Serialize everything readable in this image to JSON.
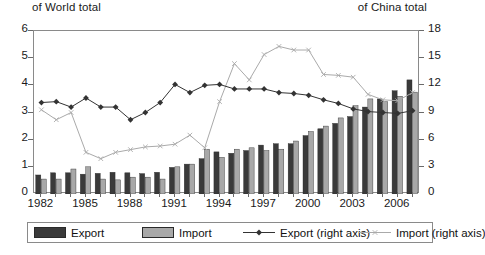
{
  "header": {
    "left_label": "of World total",
    "right_label": "of China total"
  },
  "legend": {
    "items": [
      {
        "label": "Export",
        "kind": "bar",
        "color": "#3a3a3a"
      },
      {
        "label": "Import",
        "kind": "bar",
        "color": "#a8a8a8"
      },
      {
        "label": "Export (right axis)",
        "kind": "line",
        "color": "#333333",
        "marker": "diamond"
      },
      {
        "label": "Import (right axis)",
        "kind": "line",
        "color": "#aaaaaa",
        "marker": "cross"
      }
    ]
  },
  "chart_data": {
    "type": "bar",
    "title": "",
    "xlabel": "",
    "ylabel": "of World total",
    "y2label": "of China total",
    "ylim": [
      0,
      6
    ],
    "y2lim": [
      0,
      18
    ],
    "yticks": [
      "0",
      "1",
      "2",
      "3",
      "4",
      "5",
      "6"
    ],
    "y2ticks": [
      "0",
      "3",
      "6",
      "9",
      "12",
      "15",
      "18"
    ],
    "grid": false,
    "legend_position": "bottom",
    "x": [
      1982,
      1983,
      1984,
      1985,
      1986,
      1987,
      1988,
      1989,
      1990,
      1991,
      1992,
      1993,
      1994,
      1995,
      1996,
      1997,
      1998,
      1999,
      2000,
      2001,
      2002,
      2003,
      2004,
      2005,
      2006,
      2007
    ],
    "xtick_labels": [
      "1982",
      "1985",
      "1988",
      "1991",
      "1994",
      "1997",
      "2000",
      "2003",
      "2006"
    ],
    "xtick_values": [
      1982,
      1985,
      1988,
      1991,
      1994,
      1997,
      2000,
      2003,
      2006
    ],
    "series": [
      {
        "name": "Export",
        "axis": "left",
        "type": "bar",
        "color": "#3a3a3a",
        "values": [
          0.7,
          0.78,
          0.78,
          0.73,
          0.76,
          0.8,
          0.78,
          0.75,
          0.8,
          0.98,
          1.1,
          1.3,
          1.55,
          1.5,
          1.6,
          1.8,
          1.85,
          1.85,
          2.15,
          2.4,
          2.6,
          2.85,
          3.2,
          3.5,
          3.8,
          4.2
        ]
      },
      {
        "name": "Import",
        "axis": "left",
        "type": "bar",
        "color": "#a8a8a8",
        "values": [
          0.55,
          0.55,
          0.92,
          1.0,
          0.55,
          0.52,
          0.62,
          0.62,
          0.55,
          1.0,
          1.1,
          1.65,
          1.35,
          1.65,
          1.7,
          1.6,
          1.65,
          1.95,
          2.3,
          2.5,
          2.8,
          3.25,
          3.5,
          3.4,
          3.6,
          3.75
        ]
      },
      {
        "name": "Export (right axis)",
        "axis": "right",
        "type": "line",
        "color": "#333333",
        "marker": "diamond",
        "values": [
          10.1,
          10.2,
          9.6,
          10.6,
          9.6,
          9.6,
          8.2,
          9.0,
          10.1,
          12.1,
          11.2,
          12.0,
          12.1,
          11.6,
          11.6,
          11.6,
          11.2,
          11.1,
          10.9,
          10.4,
          10.0,
          9.4,
          9.1,
          9.0,
          8.9,
          9.2
        ]
      },
      {
        "name": "Import (right axis)",
        "axis": "right",
        "type": "line",
        "color": "#aaaaaa",
        "marker": "cross",
        "values": [
          9.3,
          8.2,
          9.0,
          4.6,
          3.9,
          4.6,
          4.9,
          5.2,
          5.3,
          5.5,
          6.5,
          5.1,
          10.2,
          14.4,
          12.6,
          15.4,
          16.3,
          15.9,
          15.9,
          13.2,
          13.1,
          12.9,
          11.0,
          10.4,
          10.3,
          11.2
        ]
      }
    ]
  }
}
